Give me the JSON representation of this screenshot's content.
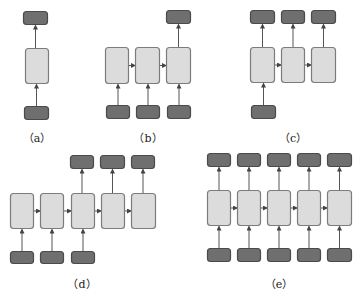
{
  "colors": {
    "io_fill": "#6f6f6f",
    "io_stroke": "#4a4a4a",
    "hidden_fill": "#dcdcdc",
    "hidden_stroke": "#7c7c7c",
    "arrow": "#555555"
  },
  "panels": [
    {
      "id": "a",
      "label": "（a）",
      "label_pos": [
        37,
        129
      ],
      "inputs": [
        [
          24,
          106,
          24,
          13
        ]
      ],
      "hidden": [
        [
          25,
          48,
          23,
          35
        ]
      ],
      "outputs": [
        [
          23,
          11,
          24,
          13
        ]
      ],
      "connections": "one-to-one"
    },
    {
      "id": "b",
      "label": "（b）",
      "label_pos": [
        148,
        129
      ],
      "inputs": [
        [
          106,
          105,
          23,
          13
        ],
        [
          136,
          105,
          23,
          13
        ],
        [
          167,
          105,
          23,
          13
        ]
      ],
      "hidden": [
        [
          105,
          47,
          23,
          36
        ],
        [
          135,
          47,
          24,
          36
        ],
        [
          166,
          47,
          24,
          36
        ]
      ],
      "outputs": [
        [
          166,
          10,
          24,
          13
        ]
      ],
      "connections": "many-to-one"
    },
    {
      "id": "c",
      "label": "（c）",
      "label_pos": [
        293,
        129
      ],
      "inputs": [
        [
          251,
          105,
          24,
          13
        ]
      ],
      "hidden": [
        [
          250,
          47,
          24,
          35
        ],
        [
          281,
          47,
          23,
          35
        ],
        [
          311,
          47,
          24,
          35
        ]
      ],
      "outputs": [
        [
          250,
          10,
          24,
          13
        ],
        [
          281,
          10,
          23,
          13
        ],
        [
          311,
          10,
          24,
          13
        ]
      ],
      "connections": "one-to-many"
    },
    {
      "id": "d",
      "label": "（d）",
      "label_pos": [
        82,
        275
      ],
      "inputs": [
        [
          10,
          251,
          23,
          12
        ],
        [
          40,
          251,
          23,
          12
        ],
        [
          71,
          251,
          23,
          12
        ]
      ],
      "hidden": [
        [
          10,
          193,
          23,
          35
        ],
        [
          40,
          193,
          23,
          35
        ],
        [
          71,
          193,
          23,
          35
        ],
        [
          101,
          193,
          23,
          35
        ],
        [
          131,
          193,
          24,
          35
        ]
      ],
      "outputs": [
        [
          70,
          155,
          23,
          13
        ],
        [
          100,
          155,
          24,
          13
        ],
        [
          131,
          155,
          23,
          13
        ]
      ],
      "connections": "many-to-many (delayed)"
    },
    {
      "id": "e",
      "label": "（e）",
      "label_pos": [
        279,
        275
      ],
      "inputs": [
        [
          207,
          248,
          23,
          13
        ],
        [
          237,
          248,
          23,
          13
        ],
        [
          267,
          248,
          23,
          13
        ],
        [
          297,
          248,
          23,
          13
        ],
        [
          327,
          248,
          24,
          13
        ]
      ],
      "hidden": [
        [
          207,
          190,
          23,
          35
        ],
        [
          237,
          190,
          23,
          35
        ],
        [
          267,
          190,
          23,
          35
        ],
        [
          297,
          190,
          23,
          35
        ],
        [
          327,
          190,
          24,
          35
        ]
      ],
      "outputs": [
        [
          207,
          153,
          23,
          13
        ],
        [
          237,
          153,
          23,
          13
        ],
        [
          267,
          153,
          23,
          13
        ],
        [
          297,
          153,
          23,
          13
        ],
        [
          327,
          153,
          24,
          13
        ]
      ],
      "connections": "many-to-many (synced)"
    }
  ]
}
